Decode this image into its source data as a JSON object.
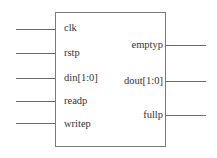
{
  "diagram": {
    "type": "block",
    "inputs": [
      {
        "label": "clk",
        "y": 29
      },
      {
        "label": "rstp",
        "y": 53
      },
      {
        "label": "din[1:0]",
        "y": 78
      },
      {
        "label": "readp",
        "y": 101
      },
      {
        "label": "writep",
        "y": 123
      }
    ],
    "outputs": [
      {
        "label": "emptyp",
        "y": 45
      },
      {
        "label": "dout[1:0]",
        "y": 81
      },
      {
        "label": "fullp",
        "y": 115
      }
    ]
  }
}
